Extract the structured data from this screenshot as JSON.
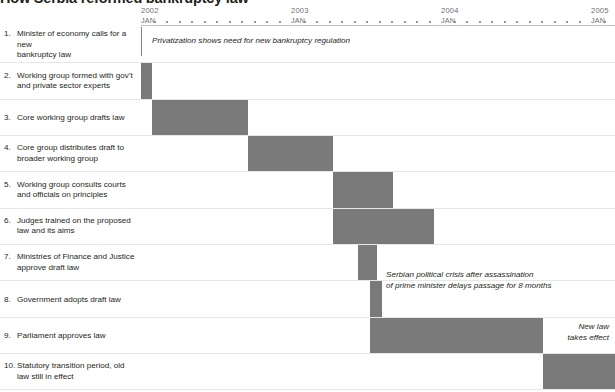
{
  "title": "How Serbia reformed bankruptcy law",
  "axis": {
    "years": [
      "2002",
      "2003",
      "2004",
      "2005"
    ],
    "month_label": "JAN",
    "months_per_year": 12,
    "px_per_year": 150,
    "origin_x": 141
  },
  "annotations": {
    "privatization": "Privatization shows need for new bankruptcy regulation",
    "crisis": "Serbian political crisis after assassination\nof prime minister delays passage for 8 months",
    "newlaw": "New law\ntakes effect"
  },
  "colors": {
    "bar": "#7a7a7a",
    "text": "#231f20",
    "axis_text": "#6d6e71",
    "rule": "#e6e7e8",
    "background": "#ffffff"
  },
  "chart_data": {
    "type": "bar",
    "title": "How Serbia reformed bankruptcy law",
    "xlabel": "",
    "ylabel": "",
    "orientation": "horizontal-gantt",
    "xlim": [
      "2002-01",
      "2005-02"
    ],
    "grid": false,
    "legend": "none",
    "categories": [
      "1. Minister of economy calls for a new bankruptcy law",
      "2. Working group formed with gov't and private sector experts",
      "3. Core working group drafts law",
      "4. Core group distributes draft to broader working group",
      "5. Working group consults courts and officials on principles",
      "6. Judges trained on the proposed law and its aims",
      "7. Ministries of Finance and Justice approve draft law",
      "8. Government adopts draft law",
      "9. Parliament approves law",
      "10. Statutory transition period, old law still in effect"
    ],
    "tasks": [
      {
        "n": "1.",
        "num": "1.",
        "label": "Minister of economy calls for a new bankruptcy law",
        "label_lines": [
          "Minister of economy calls for a new",
          "bankruptcy law"
        ],
        "start_x": 141,
        "width": 0,
        "start": "2002-01",
        "end": "2002-01",
        "milestone": true
      },
      {
        "n": "2.",
        "num": "2.",
        "label": "Working group formed with gov't and private sector experts",
        "label_lines": [
          "Working group formed with gov't",
          "and private sector experts"
        ],
        "start_x": 141,
        "width": 11,
        "start": "2002-01",
        "end": "2002-02"
      },
      {
        "n": "3.",
        "num": "3.",
        "label": "Core working group drafts law",
        "label_lines": [
          "Core working group drafts law"
        ],
        "start_x": 152,
        "width": 96,
        "start": "2002-02",
        "end": "2002-10"
      },
      {
        "n": "4.",
        "num": "4.",
        "label": "Core group distributes draft to broader working group",
        "label_lines": [
          "Core group distributes draft to broader working group"
        ],
        "start_x": 248,
        "width": 85,
        "start": "2002-10",
        "end": "2003-07"
      },
      {
        "n": "5.",
        "num": "5.",
        "label": "Working group consults courts and officials on principles",
        "label_lines": [
          "Working group consults courts and officials on principles"
        ],
        "start_x": 333,
        "width": 60,
        "start": "2003-07",
        "end": "2003-12"
      },
      {
        "n": "6.",
        "num": "6.",
        "label": "Judges trained on the proposed law and its aims",
        "label_lines": [
          "Judges trained on the proposed law and its aims"
        ],
        "start_x": 333,
        "width": 101,
        "start": "2003-07",
        "end": "2004-03"
      },
      {
        "n": "7.",
        "num": "7.",
        "label": "Ministries of Finance and Justice approve draft law",
        "label_lines": [
          "Ministries of Finance and Justice approve draft law"
        ],
        "start_x": 358,
        "width": 19,
        "start": "2003-09",
        "end": "2003-11"
      },
      {
        "n": "8.",
        "num": "8.",
        "label": "Government adopts draft law",
        "label_lines": [
          "Government adopts draft law"
        ],
        "start_x": 370,
        "width": 12,
        "start": "2003-11",
        "end": "2003-12"
      },
      {
        "n": "9.",
        "num": "9.",
        "label": "Parliament approves law",
        "label_lines": [
          "Parliament approves law"
        ],
        "start_x": 370,
        "width": 173,
        "start": "2003-11",
        "end": "2005-01"
      },
      {
        "n": "10.",
        "num": "10.",
        "label": "Statutory transition period, old law still in effect",
        "label_lines": [
          "Statutory transition period, old law still in effect"
        ],
        "start_x": 543,
        "width": 72,
        "start": "2005-01",
        "end": "2005-07"
      }
    ]
  }
}
